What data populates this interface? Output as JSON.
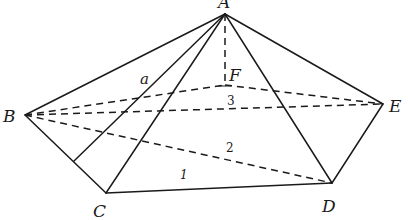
{
  "diagram": {
    "type": "pyramid",
    "vertices": {
      "A": {
        "label": "A",
        "x": 225,
        "y": 14
      },
      "B": {
        "label": "B",
        "x": 25,
        "y": 115
      },
      "C": {
        "label": "C",
        "x": 106,
        "y": 193
      },
      "D": {
        "label": "D",
        "x": 332,
        "y": 183
      },
      "E": {
        "label": "E",
        "x": 383,
        "y": 104
      },
      "F": {
        "label": "F",
        "x": 225,
        "y": 85
      }
    },
    "auxiliary_points": {
      "BC_foot": {
        "x": 74,
        "y": 161
      }
    },
    "solid_edges": [
      [
        "A",
        "B"
      ],
      [
        "A",
        "BC_foot"
      ],
      [
        "A",
        "C"
      ],
      [
        "A",
        "D"
      ],
      [
        "A",
        "E"
      ],
      [
        "B",
        "C"
      ],
      [
        "C",
        "D"
      ],
      [
        "D",
        "E"
      ]
    ],
    "dashed_edges": [
      [
        "A",
        "F"
      ],
      [
        "B",
        "F"
      ],
      [
        "F",
        "E"
      ],
      [
        "B",
        "E"
      ],
      [
        "B",
        "D"
      ]
    ],
    "labels": {
      "a": "a",
      "n1": "1",
      "n2": "2",
      "n3": "3"
    }
  }
}
